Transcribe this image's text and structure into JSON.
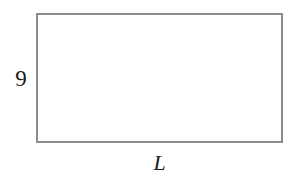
{
  "figure": {
    "kind": "geometry-diagram",
    "background_color": "#ffffff",
    "canvas": {
      "width": 300,
      "height": 179
    },
    "shape": {
      "name": "rectangle",
      "x": 36,
      "y": 13,
      "width": 247,
      "height": 130,
      "stroke_color": "#8c8c8c",
      "stroke_width": 2,
      "fill_color": "#ffffff"
    },
    "labels": {
      "height": {
        "text": "9",
        "position": "left",
        "color": "#1a1a1a",
        "style": "normal"
      },
      "length": {
        "text": "L",
        "position": "bottom",
        "color": "#1a1a1a",
        "style": "italic"
      }
    }
  }
}
